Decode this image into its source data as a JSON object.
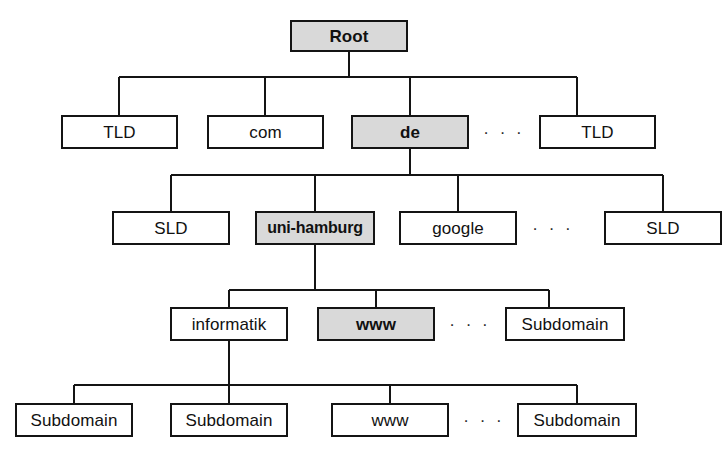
{
  "diagram": {
    "type": "tree",
    "colors": {
      "highlight_fill": "#d9d9d9",
      "node_fill": "#ffffff",
      "stroke": "#141414",
      "text": "#111111"
    },
    "ellipsis_glyph": "· · ·",
    "levels": [
      {
        "name": "root-level",
        "nodes": [
          {
            "id": "root",
            "label": "Root",
            "highlight": true,
            "bold": true
          }
        ]
      },
      {
        "name": "tld-level",
        "nodes": [
          {
            "id": "tld-left",
            "label": "TLD",
            "highlight": false,
            "bold": false
          },
          {
            "id": "com",
            "label": "com",
            "highlight": false,
            "bold": false
          },
          {
            "id": "de",
            "label": "de",
            "highlight": true,
            "bold": true
          },
          {
            "id": "tld-right",
            "label": "TLD",
            "highlight": false,
            "bold": false
          }
        ],
        "ellipsis_after": "de"
      },
      {
        "name": "sld-level",
        "nodes": [
          {
            "id": "sld-left",
            "label": "SLD",
            "highlight": false,
            "bold": false
          },
          {
            "id": "uni-hamburg",
            "label": "uni-hamburg",
            "highlight": true,
            "bold": true
          },
          {
            "id": "google",
            "label": "google",
            "highlight": false,
            "bold": false
          },
          {
            "id": "sld-right",
            "label": "SLD",
            "highlight": false,
            "bold": false
          }
        ],
        "ellipsis_after": "google"
      },
      {
        "name": "subdomain-level-1",
        "nodes": [
          {
            "id": "informatik",
            "label": "informatik",
            "highlight": false,
            "bold": false
          },
          {
            "id": "www-level4",
            "label": "www",
            "highlight": true,
            "bold": true
          },
          {
            "id": "subdomain-right-4",
            "label": "Subdomain",
            "highlight": false,
            "bold": false
          }
        ],
        "ellipsis_after": "www-level4"
      },
      {
        "name": "subdomain-level-2",
        "nodes": [
          {
            "id": "subdomain-a",
            "label": "Subdomain",
            "highlight": false,
            "bold": false
          },
          {
            "id": "subdomain-b",
            "label": "Subdomain",
            "highlight": false,
            "bold": false
          },
          {
            "id": "www-level5",
            "label": "www",
            "highlight": false,
            "bold": false
          },
          {
            "id": "subdomain-c",
            "label": "Subdomain",
            "highlight": false,
            "bold": false
          }
        ],
        "ellipsis_after": "www-level5"
      }
    ]
  }
}
